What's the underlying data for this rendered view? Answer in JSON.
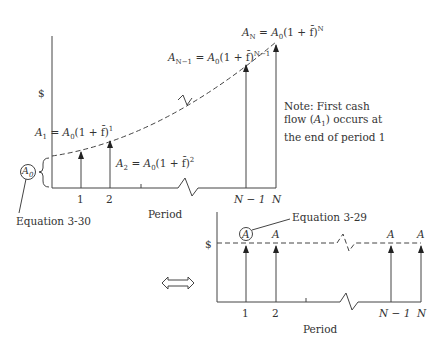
{
  "top_chart": {
    "y_axis_label": "$",
    "x_axis_label": "Period",
    "x_ticks": [
      "1",
      "2",
      "N − 1",
      "N"
    ],
    "base_label": "A0",
    "base_equation_ref": "Equation 3-30",
    "cash_flows": [
      {
        "period": "1",
        "label_prefix": "A",
        "sub": "1",
        "eq": " = A",
        "eq_sub": "0",
        "eq_rest": "(1 + f̄)",
        "exp": "1"
      },
      {
        "period": "2",
        "label_prefix": "A",
        "sub": "2",
        "eq": " = A",
        "eq_sub": "0",
        "eq_rest": "(1 + f̄)",
        "exp": "2"
      },
      {
        "period": "N − 1",
        "label_prefix": "A",
        "sub": "N−1",
        "eq": " = A",
        "eq_sub": "0",
        "eq_rest": "(1 + f̄)",
        "exp": "N−1"
      },
      {
        "period": "N",
        "label_prefix": "A",
        "sub": "N",
        "eq": " = A",
        "eq_sub": "0",
        "eq_rest": "(1  +  f̄)",
        "exp": "N"
      }
    ],
    "note": {
      "line1": "Note: First cash",
      "line2_prefix": "flow (",
      "line2_var": "A",
      "line2_sub": "1",
      "line2_suffix": ") occurs at",
      "line3": "the end of period 1"
    }
  },
  "equivalence_symbol": "⇔",
  "bottom_chart": {
    "y_axis_label": "$",
    "x_axis_label": "Period",
    "x_ticks": [
      "1",
      "2",
      "N − 1",
      "N"
    ],
    "cash_flow_label": "A",
    "equation_ref": "Equation 3-29"
  }
}
